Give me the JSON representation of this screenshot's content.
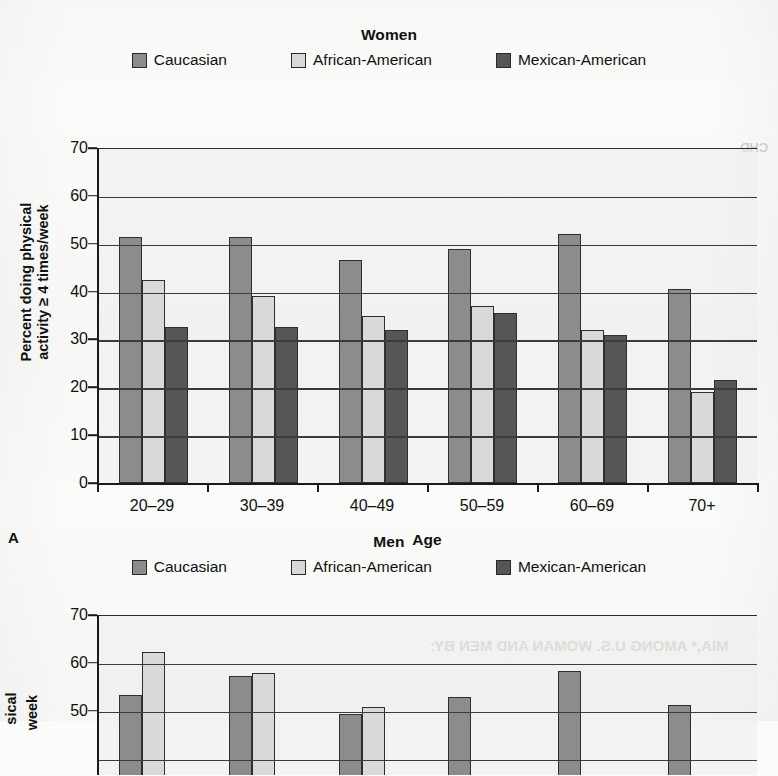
{
  "figure": {
    "background_color": "#fbfbfa",
    "series_colors": {
      "caucasian": "#8c8c8c",
      "african_american": "#d9d9d7",
      "mexican_american": "#565656"
    },
    "legend_labels": {
      "caucasian": "Caucasian",
      "african_american": "African-American",
      "mexican_american": "Mexican-American"
    },
    "icon_names": {
      "swatch_caucasian": "legend-swatch-icon",
      "swatch_african_american": "legend-swatch-icon",
      "swatch_mexican_american": "legend-swatch-icon"
    }
  },
  "panel_a": {
    "letter": "A",
    "title": "Women",
    "ylabel": "Percent doing physical\nactivity ≥ 4 times/week",
    "xlabel": "Age",
    "yticks": [
      "70",
      "60",
      "50",
      "40",
      "30",
      "20",
      "10",
      "0"
    ],
    "xticklabels": [
      "20–29",
      "30–39",
      "40–49",
      "50–59",
      "60–69",
      "70+"
    ]
  },
  "panel_b": {
    "letter": "B",
    "title": "Men",
    "ylabel_visible_fragments": [
      "sical",
      "week"
    ],
    "yticks": [
      "70",
      "60",
      "50"
    ],
    "clipped": "bottom of figure is cut off by the page edge"
  },
  "show_through_text": [
    "CHD",
    "MIA,* AMONG U.S. WOMAN AND MEN BY:"
  ],
  "chart_data": [
    {
      "type": "bar",
      "panel": "A",
      "title": "Women",
      "xlabel": "Age",
      "ylabel": "Percent doing physical activity ≥ 4 times/week",
      "categories": [
        "20–29",
        "30–39",
        "40–49",
        "50–59",
        "60–69",
        "70+"
      ],
      "series": [
        {
          "name": "Caucasian",
          "color": "#8c8c8c",
          "values": [
            51.5,
            51.5,
            46.5,
            49.0,
            52.0,
            40.5
          ]
        },
        {
          "name": "African-American",
          "color": "#d9d9d7",
          "values": [
            42.5,
            39.0,
            35.0,
            37.0,
            32.0,
            19.0
          ]
        },
        {
          "name": "Mexican-American",
          "color": "#565656",
          "values": [
            32.5,
            32.5,
            32.0,
            35.5,
            31.0,
            21.5
          ]
        }
      ],
      "ylim": [
        0,
        70
      ],
      "ytick_step": 10,
      "grid": true,
      "legend_position": "top"
    },
    {
      "type": "bar",
      "panel": "B",
      "title": "Men",
      "xlabel": "Age",
      "ylabel": "Percent doing physical activity ≥ 4 times/week",
      "categories": [
        "20–29",
        "30–39",
        "40–49",
        "50–59",
        "60–69",
        "70+"
      ],
      "series": [
        {
          "name": "Caucasian",
          "color": "#8c8c8c",
          "values": [
            53.5,
            57.5,
            49.5,
            53.0,
            58.5,
            51.5
          ]
        },
        {
          "name": "African-American",
          "color": "#d9d9d7",
          "values": [
            62.5,
            58.0,
            51.0,
            null,
            null,
            null
          ]
        },
        {
          "name": "Mexican-American",
          "color": "#565656",
          "values": [
            null,
            null,
            null,
            null,
            null,
            null
          ]
        }
      ],
      "ylim": [
        0,
        70
      ],
      "ytick_step": 10,
      "grid": true,
      "legend_position": "top",
      "note": "lower portion clipped by image boundary"
    }
  ]
}
